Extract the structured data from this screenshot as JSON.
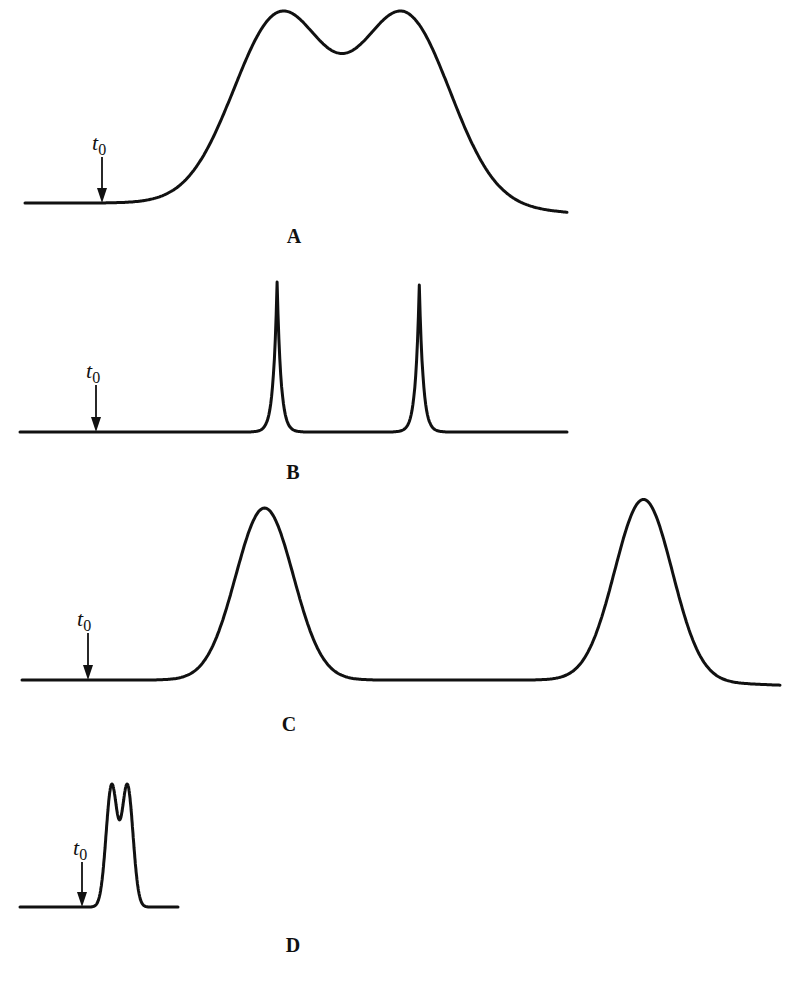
{
  "chart_data": {
    "type": "line",
    "title": "",
    "xlabel": "",
    "ylabel": "",
    "marker_label": {
      "symbol": "t",
      "subscript": "0"
    },
    "panels": [
      {
        "label": "A",
        "note": "broad, poorly resolved overlapping peaks",
        "baseline_start_x": 0.0,
        "baseline_end_x": 1.0,
        "t0_x": 0.14,
        "tail_offset": -0.05,
        "peaks": [
          {
            "center": 0.47,
            "height": 1.0,
            "width": 0.085
          },
          {
            "center": 0.7,
            "height": 1.0,
            "width": 0.085
          }
        ],
        "valley_height": 0.5
      },
      {
        "label": "B",
        "note": "narrow, well resolved peaks",
        "t0_x": 0.14,
        "tail_offset": 0.0,
        "peaks": [
          {
            "center": 0.47,
            "height": 1.0,
            "width": 0.008
          },
          {
            "center": 0.73,
            "height": 0.98,
            "width": 0.008
          }
        ]
      },
      {
        "label": "C",
        "note": "broad peaks, widely separated",
        "t0_x": 0.09,
        "tail_offset": -0.03,
        "peaks": [
          {
            "center": 0.32,
            "height": 1.0,
            "width": 0.038
          },
          {
            "center": 0.82,
            "height": 1.05,
            "width": 0.038
          }
        ]
      },
      {
        "label": "D",
        "note": "narrow, closely spaced peaks, early elution",
        "t0_x": 0.39,
        "tail_offset": 0.0,
        "peaks": [
          {
            "center": 0.58,
            "height": 1.0,
            "width": 0.035
          },
          {
            "center": 0.68,
            "height": 1.0,
            "width": 0.035
          }
        ],
        "valley_height": 0.55
      }
    ]
  }
}
